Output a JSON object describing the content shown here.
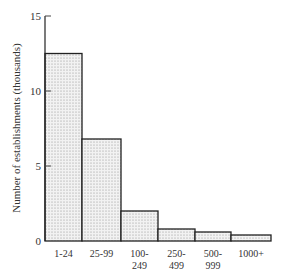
{
  "chart_data": {
    "type": "bar",
    "title": "",
    "xlabel": "",
    "ylabel": "Number of establishments (thousands)",
    "categories": [
      [
        "1-24"
      ],
      [
        "25-99"
      ],
      [
        "100-",
        "249"
      ],
      [
        "250-",
        "499"
      ],
      [
        "500-",
        "999"
      ],
      [
        "1000+"
      ]
    ],
    "category_names": [
      "1-24",
      "25-99",
      "100-249",
      "250-499",
      "500-999",
      "1000+"
    ],
    "values": [
      12.5,
      6.8,
      2.0,
      0.8,
      0.6,
      0.4
    ],
    "ylim": [
      0,
      15
    ],
    "yticks": [
      0,
      5,
      10,
      15
    ],
    "grid": false,
    "legend": null,
    "style": {
      "fill": "dotted light gray",
      "edge": "#222222"
    }
  }
}
